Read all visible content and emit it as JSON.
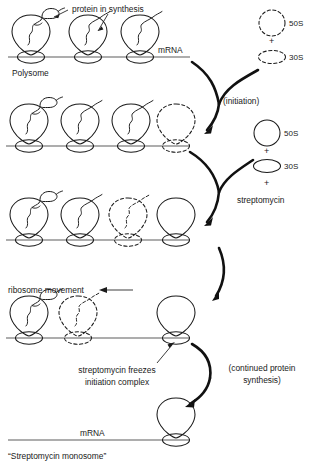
{
  "figure": {
    "caption_bottom": "“Streptomycin monosome”",
    "line_color": "#5d5d5d",
    "ink_color": "#1a1a1a"
  },
  "labels": {
    "protein_in_synthesis": "protein in synthesis",
    "mrna_top": "mRNA",
    "polysome": "Polysome",
    "initiation": "(initiation)",
    "streptomycin": "streptomycin",
    "ribosome_movement": "ribosome movement",
    "freeze_line1": "streptomycin freezes",
    "freeze_line2": "initiation complex",
    "continued_line1": "(continued protein",
    "continued_line2": "synthesis)",
    "mrna_bottom": "mRNA",
    "monosome": "“Streptomycin monosome”"
  },
  "subunits": {
    "group_initiation": {
      "style": "dashed",
      "large_label": "50S",
      "small_label": "30S",
      "plus": "+"
    },
    "group_streptomycin": {
      "style": "solid",
      "large_label": "50S",
      "small_label": "30S",
      "plus_1": "+",
      "plus_2": "+",
      "extra_label": "streptomycin"
    }
  },
  "rows": [
    {
      "name": "polysome-row",
      "ribosomes": [
        {
          "style": "solid",
          "chain": "folded-protein"
        },
        {
          "style": "solid",
          "chain": "squiggle"
        },
        {
          "style": "solid",
          "chain": "squiggle"
        }
      ]
    },
    {
      "name": "initiation-row",
      "ribosomes": [
        {
          "style": "solid",
          "chain": "folded-protein"
        },
        {
          "style": "solid",
          "chain": "squiggle"
        },
        {
          "style": "solid",
          "chain": "squiggle"
        },
        {
          "style": "dashed",
          "chain": "none"
        }
      ]
    },
    {
      "name": "streptomycin-row",
      "ribosomes": [
        {
          "style": "solid",
          "chain": "folded-protein"
        },
        {
          "style": "solid",
          "chain": "squiggle"
        },
        {
          "style": "dashed",
          "chain": "squiggle"
        },
        {
          "style": "solid",
          "chain": "none"
        }
      ]
    },
    {
      "name": "frozen-row",
      "ribosomes": [
        {
          "style": "solid",
          "chain": "folded-protein"
        },
        {
          "style": "dashed",
          "chain": "squiggle"
        },
        {
          "style": "solid",
          "chain": "none"
        }
      ]
    },
    {
      "name": "monosome-row",
      "ribosomes": [
        {
          "style": "solid",
          "chain": "none"
        }
      ]
    }
  ]
}
